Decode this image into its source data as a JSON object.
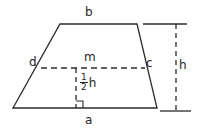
{
  "figure": {
    "shape": "trapezoid",
    "stroke_color": "#2b2b2b",
    "background_color": "#ffffff",
    "labels": {
      "top_base": "b",
      "bottom_base": "a",
      "left_midpoint": "d",
      "right_midpoint": "c",
      "midsegment": "m",
      "height": "h",
      "half_height_numerator": "1",
      "half_height_denominator": "2",
      "half_height_variable": "h"
    },
    "geometry": {
      "top_left": [
        60,
        24
      ],
      "top_right": [
        137,
        24
      ],
      "bottom_left": [
        13,
        108
      ],
      "bottom_right": [
        157,
        108
      ],
      "midsegment_left": [
        41,
        68
      ],
      "midsegment_right": [
        145,
        68
      ],
      "half_height_line_x": 76,
      "half_height_line_top_y": 68,
      "half_height_line_bottom_y": 108,
      "right_angle_marker": [
        76,
        101,
        7,
        7
      ],
      "height_bracket_x": 176,
      "height_bracket_top_y": 24,
      "height_bracket_bottom_y": 111,
      "height_tick_top": [
        143,
        185
      ],
      "height_tick_bottom": [
        160,
        190
      ]
    }
  }
}
